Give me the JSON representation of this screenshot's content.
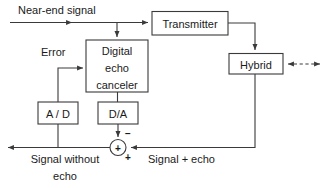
{
  "diagram": {
    "stroke_color": "#3a3a3a",
    "text_color": "#1a1a1a",
    "background": "#ffffff",
    "blocks": {
      "transmitter": "Transmitter",
      "hybrid": "Hybrid",
      "canceler_line1": "Digital",
      "canceler_line2": "echo",
      "canceler_line3": "canceler",
      "adc": "A / D",
      "dac": "D/A"
    },
    "labels": {
      "near_end_signal": "Near-end  signal",
      "error": "Error",
      "signal_without_echo_line1": "Signal without",
      "signal_without_echo_line2": "echo",
      "signal_plus_echo": "Signal + echo"
    },
    "signs": {
      "minus": "−",
      "plus_in_circle": "+",
      "plus_input": "+"
    }
  }
}
